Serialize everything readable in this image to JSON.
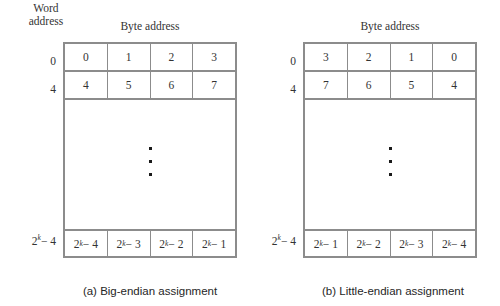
{
  "figure": {
    "word_address_label_line1": "Word",
    "word_address_label_line2": "address",
    "ellipsis_dot_count": 3
  },
  "panels": [
    {
      "id": "big-endian",
      "column_header": "Byte address",
      "caption": "(a) Big-endian assignment",
      "row_labels": [
        "0",
        "4",
        "2k−4"
      ],
      "row_label_parts": [
        {
          "base": "0",
          "exp": "",
          "tail": ""
        },
        {
          "base": "4",
          "exp": "",
          "tail": ""
        },
        {
          "base": "2",
          "exp": "k",
          "tail": "− 4"
        }
      ],
      "rows": [
        {
          "label": "0",
          "cells": [
            {
              "base": "0",
              "exp": "",
              "tail": ""
            },
            {
              "base": "1",
              "exp": "",
              "tail": ""
            },
            {
              "base": "2",
              "exp": "",
              "tail": ""
            },
            {
              "base": "3",
              "exp": "",
              "tail": ""
            }
          ]
        },
        {
          "label": "4",
          "cells": [
            {
              "base": "4",
              "exp": "",
              "tail": ""
            },
            {
              "base": "5",
              "exp": "",
              "tail": ""
            },
            {
              "base": "6",
              "exp": "",
              "tail": ""
            },
            {
              "base": "7",
              "exp": "",
              "tail": ""
            }
          ]
        },
        {
          "label": "2k−4",
          "cells": [
            {
              "base": "2",
              "exp": "k",
              "tail": "− 4"
            },
            {
              "base": "2",
              "exp": "k",
              "tail": "− 3"
            },
            {
              "base": "2",
              "exp": "k",
              "tail": "− 2"
            },
            {
              "base": "2",
              "exp": "k",
              "tail": "− 1"
            }
          ]
        }
      ]
    },
    {
      "id": "little-endian",
      "column_header": "Byte address",
      "caption": "(b) Little-endian assignment",
      "row_labels": [
        "0",
        "4",
        "2k−4"
      ],
      "row_label_parts": [
        {
          "base": "0",
          "exp": "",
          "tail": ""
        },
        {
          "base": "4",
          "exp": "",
          "tail": ""
        },
        {
          "base": "2",
          "exp": "k",
          "tail": "− 4"
        }
      ],
      "rows": [
        {
          "label": "0",
          "cells": [
            {
              "base": "3",
              "exp": "",
              "tail": ""
            },
            {
              "base": "2",
              "exp": "",
              "tail": ""
            },
            {
              "base": "1",
              "exp": "",
              "tail": ""
            },
            {
              "base": "0",
              "exp": "",
              "tail": ""
            }
          ]
        },
        {
          "label": "4",
          "cells": [
            {
              "base": "7",
              "exp": "",
              "tail": ""
            },
            {
              "base": "6",
              "exp": "",
              "tail": ""
            },
            {
              "base": "5",
              "exp": "",
              "tail": ""
            },
            {
              "base": "4",
              "exp": "",
              "tail": ""
            }
          ]
        },
        {
          "label": "2k−4",
          "cells": [
            {
              "base": "2",
              "exp": "k",
              "tail": "− 1"
            },
            {
              "base": "2",
              "exp": "k",
              "tail": "− 2"
            },
            {
              "base": "2",
              "exp": "k",
              "tail": "− 3"
            },
            {
              "base": "2",
              "exp": "k",
              "tail": "− 4"
            }
          ]
        }
      ]
    }
  ],
  "colors": {
    "border": "#8c8c8c",
    "text": "#333333",
    "caption_text": "#262626",
    "background": "#ffffff",
    "dot": "#1a1a1a"
  }
}
